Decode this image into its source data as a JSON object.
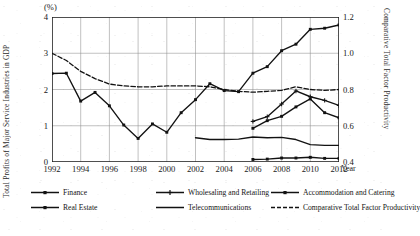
{
  "axes": {
    "left_title": "Total Profits of Major Service Industries in GDP",
    "right_title": "Comparative Total Factor Productivity",
    "unit_note": "(%)",
    "x_unit": "Year",
    "left_ticks": [
      "0",
      "1",
      "2",
      "3",
      "4"
    ],
    "right_ticks": [
      "0.4",
      "0.6",
      "0.8",
      "1.0",
      "1.2"
    ],
    "x_ticks": [
      "1992",
      "1994",
      "1996",
      "1998",
      "2000",
      "2002",
      "2004",
      "2006",
      "2008",
      "2010",
      "2012"
    ]
  },
  "legend": {
    "row1": [
      {
        "label": "Finance",
        "marker": "square",
        "style": "solid"
      },
      {
        "label": "Wholesaling and Retailing",
        "marker": "plus",
        "style": "solid"
      },
      {
        "label": "Accommodation and Catering",
        "marker": "square",
        "style": "solid"
      }
    ],
    "row2": [
      {
        "label": "Real Estate",
        "marker": "square",
        "style": "solid"
      },
      {
        "label": "Telecommunications",
        "marker": "none",
        "style": "solid"
      },
      {
        "label": "Comparative Total Factor Productivity",
        "marker": "none",
        "style": "dashed"
      }
    ]
  },
  "chart_data": {
    "type": "line",
    "title": "",
    "xlabel": "Year",
    "ylabel": "Total Profits of Major Service Industries in GDP",
    "y2label": "Comparative Total Factor Productivity",
    "unit": "(%)",
    "grid": true,
    "legend_position": "bottom",
    "x": [
      1992,
      1993,
      1994,
      1995,
      1996,
      1997,
      1998,
      1999,
      2000,
      2001,
      2002,
      2003,
      2004,
      2005,
      2006,
      2007,
      2008,
      2009,
      2010,
      2011,
      2012
    ],
    "xlim": [
      1992,
      2012
    ],
    "ylim": [
      0,
      4
    ],
    "y2lim": [
      0.4,
      1.2
    ],
    "series": [
      {
        "name": "Finance",
        "axis": "left",
        "marker": "square",
        "style": "solid",
        "values": [
          2.44,
          2.45,
          1.68,
          1.92,
          1.55,
          1.02,
          0.65,
          1.05,
          0.82,
          1.36,
          1.72,
          2.16,
          1.97,
          1.94,
          2.45,
          2.63,
          3.07,
          3.25,
          3.66,
          3.69,
          3.78
        ]
      },
      {
        "name": "Wholesaling and Retailing",
        "axis": "left",
        "marker": "plus",
        "style": "solid",
        "values": [
          null,
          null,
          null,
          null,
          null,
          null,
          null,
          null,
          null,
          null,
          null,
          null,
          null,
          null,
          1.12,
          1.25,
          1.6,
          1.96,
          1.8,
          1.7,
          1.56
        ]
      },
      {
        "name": "Accommodation and Catering",
        "axis": "left",
        "marker": "square",
        "style": "solid",
        "values": [
          null,
          null,
          null,
          null,
          null,
          null,
          null,
          null,
          null,
          null,
          null,
          null,
          null,
          null,
          0.07,
          0.08,
          0.11,
          0.11,
          0.13,
          0.1,
          0.1
        ]
      },
      {
        "name": "Real Estate",
        "axis": "left",
        "marker": "square",
        "style": "solid",
        "values": [
          null,
          null,
          null,
          null,
          null,
          null,
          null,
          null,
          null,
          null,
          null,
          null,
          null,
          null,
          0.93,
          1.14,
          1.26,
          1.52,
          1.74,
          1.36,
          1.22
        ]
      },
      {
        "name": "Telecommunications",
        "axis": "left",
        "marker": "none",
        "style": "solid",
        "values": [
          null,
          null,
          null,
          null,
          null,
          null,
          null,
          null,
          null,
          null,
          0.67,
          0.62,
          0.62,
          0.63,
          0.69,
          0.67,
          0.68,
          0.62,
          0.48,
          0.46,
          0.46
        ]
      },
      {
        "name": "Comparative Total Factor Productivity",
        "axis": "right",
        "marker": "none",
        "style": "dashed",
        "values": [
          1.0,
          0.96,
          0.9,
          0.86,
          0.83,
          0.82,
          0.815,
          0.815,
          0.82,
          0.82,
          0.82,
          0.815,
          0.8,
          0.79,
          0.785,
          0.79,
          0.795,
          0.815,
          0.8,
          0.795,
          0.8
        ]
      }
    ]
  }
}
